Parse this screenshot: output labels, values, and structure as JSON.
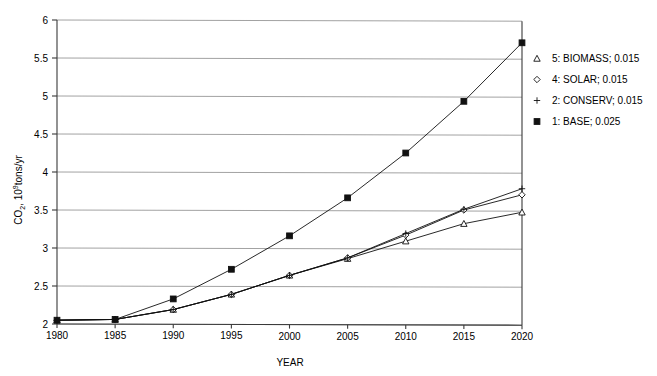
{
  "chart_data": {
    "type": "line",
    "title": "",
    "xlabel": "YEAR",
    "ylabel": "CO2, 10^9 tons/yr",
    "ylabel_parts": {
      "prefix": "CO",
      "sub": "2",
      "mid": ", 10",
      "sup": "9",
      "suffix": "tons/yr"
    },
    "x": [
      1980,
      1985,
      1990,
      1995,
      2000,
      2005,
      2010,
      2015,
      2020
    ],
    "xticklabels": [
      "1980",
      "1985",
      "1990",
      "1995",
      "2000",
      "2005",
      "2010",
      "2015",
      "2020"
    ],
    "yticklabels": [
      "2",
      "2.5",
      "3",
      "3.5",
      "4",
      "4.5",
      "5",
      "5.5",
      "6"
    ],
    "yticks": [
      2,
      2.5,
      3,
      3.5,
      4,
      4.5,
      5,
      5.5,
      6
    ],
    "xlim": [
      1980,
      2020
    ],
    "ylim": [
      2,
      6
    ],
    "grid": "horizontal",
    "legend_position": "right-outside",
    "series": [
      {
        "name": "5: BIOMASS; 0.015",
        "short": "BIOMASS",
        "rate": "0.015",
        "marker": "triangle",
        "values": [
          2.05,
          2.06,
          2.19,
          2.39,
          2.64,
          2.86,
          3.09,
          3.32,
          3.47
        ]
      },
      {
        "name": "4: SOLAR; 0.015",
        "short": "SOLAR",
        "rate": "0.015",
        "marker": "diamond",
        "values": [
          2.05,
          2.06,
          2.19,
          2.39,
          2.64,
          2.87,
          3.17,
          3.5,
          3.7
        ]
      },
      {
        "name": "2: CONSERV; 0.015",
        "short": "CONSERV",
        "rate": "0.015",
        "marker": "plus",
        "values": [
          2.05,
          2.06,
          2.19,
          2.39,
          2.64,
          2.87,
          3.19,
          3.51,
          3.78
        ]
      },
      {
        "name": "1: BASE; 0.025",
        "short": "BASE",
        "rate": "0.025",
        "marker": "square-filled",
        "values": [
          2.05,
          2.06,
          2.33,
          2.72,
          3.16,
          3.66,
          4.25,
          4.93,
          5.7
        ]
      }
    ]
  },
  "legend": {
    "entries": [
      {
        "label": "5: BIOMASS; 0.015",
        "marker": "triangle"
      },
      {
        "label": "4: SOLAR; 0.015",
        "marker": "diamond"
      },
      {
        "label": "2: CONSERV; 0.015",
        "marker": "plus"
      },
      {
        "label": "1: BASE; 0.025",
        "marker": "square-filled"
      }
    ]
  },
  "colors": {
    "line": "#111111",
    "grid": "#8a8a8a",
    "axis": "#3a3a3a",
    "background": "#ffffff"
  }
}
